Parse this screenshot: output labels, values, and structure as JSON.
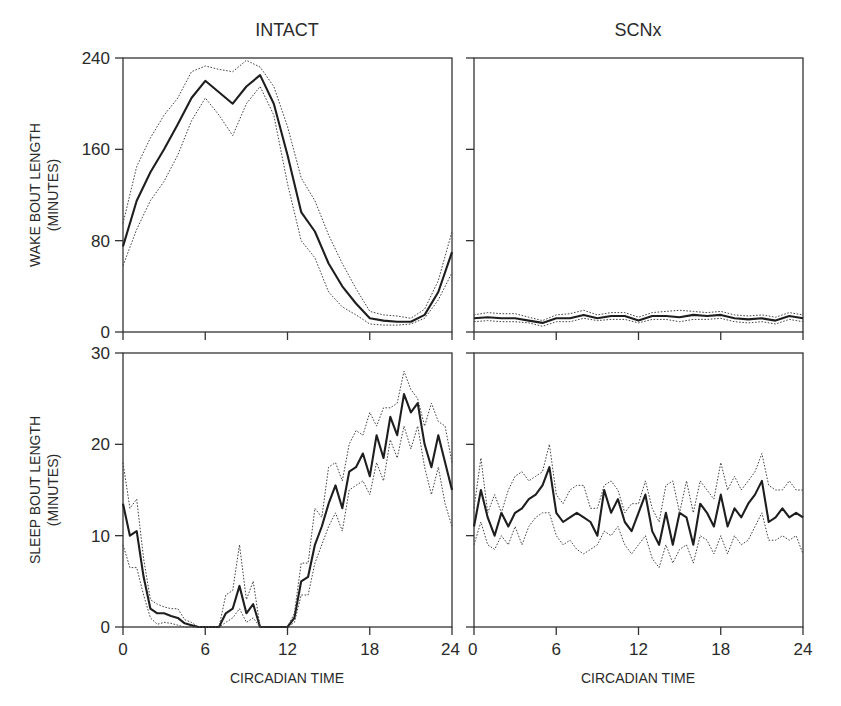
{
  "figure": {
    "columns": [
      "INTACT",
      "SCNx"
    ],
    "rows": [
      {
        "ylabel_line1": "WAKE BOUT LENGTH",
        "ylabel_line2": "(MINUTES)"
      },
      {
        "ylabel_line1": "SLEEP BOUT LENGTH",
        "ylabel_line2": "(MINUTES)"
      }
    ],
    "xlabel": "CIRCADIAN TIME"
  },
  "chart_data": [
    {
      "type": "line",
      "title": "INTACT",
      "panel": "top-left",
      "xlabel": "",
      "ylabel": "WAKE BOUT LENGTH (MINUTES)",
      "xlim": [
        0,
        24
      ],
      "ylim": [
        0,
        240
      ],
      "xticks": [
        0,
        6,
        12,
        18,
        24
      ],
      "yticks": [
        0,
        80,
        160,
        240
      ],
      "ytick_labels": [
        "0",
        "80",
        "160",
        "240"
      ],
      "xtick_labels": [],
      "grid": false,
      "x": [
        0,
        1,
        2,
        3,
        4,
        5,
        6,
        7,
        8,
        9,
        10,
        11,
        12,
        13,
        14,
        15,
        16,
        17,
        18,
        19,
        20,
        21,
        22,
        23,
        24
      ],
      "series": [
        {
          "name": "mean",
          "style": "solid",
          "values": [
            75,
            115,
            140,
            160,
            182,
            205,
            220,
            210,
            200,
            215,
            225,
            200,
            155,
            105,
            88,
            60,
            40,
            25,
            12,
            10,
            9,
            9,
            15,
            35,
            70
          ]
        },
        {
          "name": "upper",
          "style": "dotted",
          "values": [
            95,
            145,
            170,
            190,
            205,
            228,
            233,
            230,
            228,
            238,
            232,
            215,
            180,
            135,
            115,
            85,
            60,
            38,
            18,
            15,
            14,
            12,
            20,
            45,
            88
          ]
        },
        {
          "name": "lower",
          "style": "dotted",
          "values": [
            58,
            90,
            115,
            132,
            155,
            185,
            205,
            190,
            172,
            200,
            215,
            190,
            130,
            80,
            65,
            35,
            22,
            15,
            7,
            6,
            6,
            7,
            12,
            28,
            52
          ]
        }
      ]
    },
    {
      "type": "line",
      "title": "SCNx",
      "panel": "top-right",
      "xlabel": "",
      "ylabel": "",
      "xlim": [
        0,
        24
      ],
      "ylim": [
        0,
        240
      ],
      "xticks": [
        0,
        6,
        12,
        18,
        24
      ],
      "yticks": [
        0,
        80,
        160,
        240
      ],
      "ytick_labels": [],
      "xtick_labels": [],
      "grid": false,
      "x": [
        0,
        1,
        2,
        3,
        4,
        5,
        6,
        7,
        8,
        9,
        10,
        11,
        12,
        13,
        14,
        15,
        16,
        17,
        18,
        19,
        20,
        21,
        22,
        23,
        24
      ],
      "series": [
        {
          "name": "mean",
          "style": "solid",
          "values": [
            12,
            13,
            12,
            12,
            10,
            8,
            12,
            12,
            15,
            12,
            14,
            14,
            10,
            14,
            14,
            13,
            15,
            14,
            15,
            12,
            11,
            12,
            10,
            14,
            12
          ]
        },
        {
          "name": "upper",
          "style": "dotted",
          "values": [
            15,
            17,
            16,
            16,
            13,
            10,
            15,
            16,
            19,
            15,
            17,
            17,
            13,
            17,
            18,
            19,
            18,
            17,
            18,
            15,
            14,
            15,
            13,
            17,
            15
          ]
        },
        {
          "name": "lower",
          "style": "dotted",
          "values": [
            9,
            10,
            9,
            9,
            8,
            5,
            9,
            9,
            12,
            10,
            11,
            11,
            8,
            11,
            11,
            9,
            11,
            11,
            12,
            9,
            8,
            9,
            7,
            11,
            9
          ]
        }
      ]
    },
    {
      "type": "line",
      "title": "",
      "panel": "bottom-left",
      "xlabel": "CIRCADIAN TIME",
      "ylabel": "SLEEP BOUT LENGTH (MINUTES)",
      "xlim": [
        0,
        24
      ],
      "ylim": [
        0,
        30
      ],
      "xticks": [
        0,
        6,
        12,
        18,
        24
      ],
      "yticks": [
        0,
        10,
        20,
        30
      ],
      "ytick_labels": [
        "0",
        "10",
        "20",
        "30"
      ],
      "xtick_labels": [
        "0",
        "6",
        "12",
        "18",
        "24"
      ],
      "grid": false,
      "x": [
        0,
        0.5,
        1,
        1.5,
        2,
        2.5,
        3,
        3.5,
        4,
        4.5,
        5,
        5.5,
        6,
        6.5,
        7,
        7.5,
        8,
        8.5,
        9,
        9.5,
        10,
        10.5,
        11,
        11.5,
        12,
        12.5,
        13,
        13.5,
        14,
        14.5,
        15,
        15.5,
        16,
        16.5,
        17,
        17.5,
        18,
        18.5,
        19,
        19.5,
        20,
        20.5,
        21,
        21.5,
        22,
        22.5,
        23,
        23.5,
        24
      ],
      "series": [
        {
          "name": "mean",
          "style": "solid",
          "values": [
            13.5,
            10,
            10.5,
            5.5,
            2,
            1.5,
            1.5,
            1.2,
            1,
            0.4,
            0.2,
            0,
            0,
            0,
            0,
            1.5,
            2,
            4.5,
            1.5,
            2.5,
            0,
            0,
            0,
            0,
            0,
            1,
            5,
            5.5,
            9,
            11,
            13.5,
            15.5,
            13,
            17,
            17.5,
            19,
            16.5,
            21,
            18.5,
            23,
            21,
            25.5,
            23.5,
            24.5,
            20,
            17.5,
            21,
            18,
            15
          ]
        },
        {
          "name": "upper",
          "style": "dotted",
          "values": [
            18,
            13,
            14,
            7.5,
            3,
            2.5,
            2.2,
            2,
            2,
            0.8,
            0.5,
            0,
            0,
            0,
            0,
            3.5,
            4,
            9,
            3,
            5,
            0,
            0,
            0,
            0,
            0,
            1.5,
            7,
            7,
            13,
            12,
            17.5,
            18,
            16,
            20,
            21.5,
            21,
            23.5,
            22,
            24,
            24,
            24.5,
            28,
            26,
            25,
            22,
            24.5,
            22.5,
            22,
            18
          ]
        },
        {
          "name": "lower",
          "style": "dotted",
          "values": [
            9,
            6.5,
            6.5,
            3.5,
            1,
            0.3,
            0.5,
            0.4,
            0.2,
            0,
            0,
            0,
            0,
            0,
            0,
            0.5,
            1,
            2,
            0.5,
            1,
            0,
            0,
            0,
            0,
            0,
            0.5,
            3.5,
            3.5,
            7,
            9,
            11,
            12.5,
            10.5,
            15,
            15.5,
            16,
            14.5,
            18,
            16,
            20.5,
            18.5,
            22,
            19.5,
            22,
            17.5,
            14.5,
            17.5,
            13.5,
            11
          ]
        }
      ]
    },
    {
      "type": "line",
      "title": "",
      "panel": "bottom-right",
      "xlabel": "CIRCADIAN TIME",
      "ylabel": "",
      "xlim": [
        0,
        24
      ],
      "ylim": [
        0,
        30
      ],
      "xticks": [
        0,
        6,
        12,
        18,
        24
      ],
      "yticks": [
        0,
        10,
        20,
        30
      ],
      "ytick_labels": [],
      "xtick_labels": [
        "0",
        "6",
        "12",
        "18",
        "24"
      ],
      "grid": false,
      "x": [
        0,
        0.5,
        1,
        1.5,
        2,
        2.5,
        3,
        3.5,
        4,
        4.5,
        5,
        5.5,
        6,
        6.5,
        7,
        7.5,
        8,
        8.5,
        9,
        9.5,
        10,
        10.5,
        11,
        11.5,
        12,
        12.5,
        13,
        13.5,
        14,
        14.5,
        15,
        15.5,
        16,
        16.5,
        17,
        17.5,
        18,
        18.5,
        19,
        19.5,
        20,
        20.5,
        21,
        21.5,
        22,
        22.5,
        23,
        23.5,
        24
      ],
      "series": [
        {
          "name": "mean",
          "style": "solid",
          "values": [
            11,
            15,
            12,
            10,
            12.5,
            11,
            12.5,
            13,
            14,
            14.5,
            15.5,
            17.5,
            12.5,
            11.5,
            12,
            12.5,
            12,
            11.5,
            10,
            15,
            12.5,
            14,
            11.5,
            10.5,
            12.5,
            14.5,
            10.5,
            9,
            12.5,
            9,
            12.5,
            12,
            9,
            13.5,
            12.5,
            11,
            14.5,
            11,
            13,
            12,
            13.5,
            14.5,
            16,
            11.5,
            12,
            13,
            12,
            12.5,
            12
          ]
        },
        {
          "name": "upper",
          "style": "dotted",
          "values": [
            13,
            18.5,
            12.5,
            14.5,
            12.5,
            15,
            16.5,
            17,
            16,
            16.5,
            17,
            20,
            14.5,
            13.5,
            15,
            15.5,
            15.5,
            13,
            13,
            15.5,
            16,
            15,
            12.5,
            13.5,
            13.5,
            16,
            13,
            11.5,
            15.5,
            16,
            12.5,
            16,
            12.5,
            16,
            15,
            14,
            18,
            15,
            16.5,
            15,
            16,
            17,
            19,
            15.5,
            15,
            15,
            16,
            15,
            15
          ]
        },
        {
          "name": "lower",
          "style": "dotted",
          "values": [
            9,
            11.5,
            9,
            8.5,
            10,
            9,
            11,
            9,
            11,
            12,
            12.5,
            12.5,
            10,
            9,
            9.5,
            8.5,
            8,
            8.5,
            9,
            10.5,
            10,
            11,
            9,
            8,
            9,
            10,
            7.5,
            6.5,
            9,
            7,
            8.5,
            9,
            7,
            10,
            9.5,
            8,
            10,
            8,
            10,
            9,
            9.5,
            11,
            12.5,
            9.5,
            9.5,
            10,
            9.5,
            10,
            8
          ]
        }
      ]
    }
  ]
}
